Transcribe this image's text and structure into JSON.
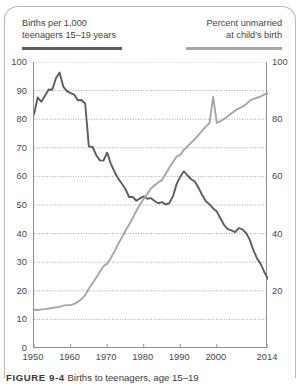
{
  "legend": {
    "left_label_line1": "Births per 1,000",
    "left_label_line2": "teenagers 15–19 years",
    "right_label_line1": "Percent unmarried",
    "right_label_line2": "at child's birth",
    "left_color": "#5d5d5d",
    "right_color": "#a6a6a6"
  },
  "caption": {
    "figure_number": "FIGURE 9-4",
    "text": "Births to teenagers, age 15–19"
  },
  "chart_data": {
    "type": "line",
    "title": "",
    "xlabel": "",
    "ylabel": "",
    "xlim": [
      1950,
      2014
    ],
    "ylim": [
      0,
      100
    ],
    "y_left_ticks": [
      0,
      10,
      20,
      30,
      40,
      50,
      60,
      70,
      80,
      90,
      100
    ],
    "y_right_ticks": [
      20,
      40,
      60,
      80,
      100
    ],
    "x_ticks": [
      1950,
      1960,
      1970,
      1980,
      1990,
      2000,
      2014
    ],
    "grid": "horizontal-dotted",
    "legend_position": "top",
    "series": [
      {
        "name": "Births per 1,000 teenagers 15–19 years",
        "color": "#5d5d5d",
        "axis": "left",
        "x": [
          1950,
          1951,
          1952,
          1953,
          1954,
          1955,
          1956,
          1957,
          1958,
          1959,
          1960,
          1961,
          1962,
          1963,
          1964,
          1965,
          1966,
          1967,
          1968,
          1969,
          1970,
          1971,
          1972,
          1973,
          1974,
          1975,
          1976,
          1977,
          1978,
          1979,
          1980,
          1981,
          1982,
          1983,
          1984,
          1985,
          1986,
          1987,
          1988,
          1989,
          1990,
          1991,
          1992,
          1993,
          1994,
          1995,
          1996,
          1997,
          1998,
          1999,
          2000,
          2001,
          2002,
          2003,
          2004,
          2005,
          2006,
          2007,
          2008,
          2009,
          2010,
          2011,
          2012,
          2013,
          2014
        ],
        "values": [
          81.6,
          87.6,
          86.1,
          88.2,
          90.4,
          90.3,
          94.3,
          96.3,
          91.4,
          89.8,
          89.1,
          88.6,
          86.6,
          86.7,
          85.5,
          70.5,
          70.3,
          67.5,
          65.6,
          65.5,
          68.3,
          64.5,
          61.7,
          59.3,
          57.5,
          55.6,
          52.8,
          52.8,
          51.5,
          52.3,
          53.0,
          52.2,
          52.4,
          51.4,
          50.6,
          51.0,
          50.2,
          50.6,
          53.0,
          57.3,
          59.9,
          61.8,
          60.3,
          59.0,
          58.2,
          56.0,
          53.5,
          51.3,
          50.3,
          48.8,
          47.7,
          45.3,
          43.0,
          41.6,
          41.1,
          40.5,
          41.9,
          41.5,
          40.2,
          37.9,
          34.2,
          31.3,
          29.4,
          26.5,
          24.2
        ]
      },
      {
        "name": "Percent unmarried at child's birth",
        "color": "#a6a6a6",
        "axis": "right",
        "x": [
          1950,
          1951,
          1952,
          1953,
          1954,
          1955,
          1956,
          1957,
          1958,
          1959,
          1960,
          1961,
          1962,
          1963,
          1964,
          1965,
          1966,
          1967,
          1968,
          1969,
          1970,
          1971,
          1972,
          1973,
          1974,
          1975,
          1976,
          1977,
          1978,
          1979,
          1980,
          1981,
          1982,
          1983,
          1984,
          1985,
          1986,
          1987,
          1988,
          1989,
          1990,
          1991,
          1992,
          1993,
          1994,
          1995,
          1996,
          1997,
          1998,
          1999,
          2000,
          2001,
          2002,
          2003,
          2004,
          2005,
          2006,
          2007,
          2008,
          2009,
          2010,
          2011,
          2012,
          2013,
          2014
        ],
        "values": [
          13.4,
          13.3,
          13.5,
          13.6,
          13.8,
          14.0,
          14.2,
          14.4,
          14.8,
          15.0,
          15.0,
          15.4,
          16.1,
          17.1,
          18.5,
          20.8,
          22.6,
          24.6,
          26.6,
          28.6,
          29.5,
          31.4,
          33.8,
          36.3,
          38.6,
          41.0,
          43.1,
          45.4,
          48.0,
          50.2,
          52.1,
          53.9,
          55.8,
          56.9,
          57.9,
          58.7,
          60.8,
          63.0,
          65.0,
          66.9,
          67.5,
          69.3,
          70.5,
          71.8,
          73.0,
          74.5,
          75.9,
          77.5,
          78.6,
          87.8,
          78.7,
          79.3,
          80.1,
          81.0,
          82.1,
          83.0,
          83.8,
          84.3,
          85.2,
          86.5,
          87.0,
          87.5,
          88.0,
          88.7,
          89.1
        ]
      }
    ]
  }
}
